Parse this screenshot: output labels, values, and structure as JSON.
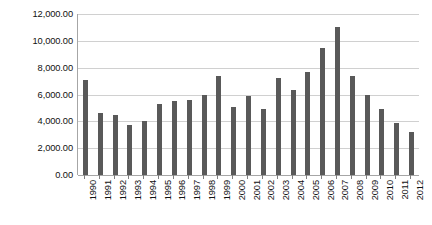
{
  "chart_data": {
    "type": "bar",
    "title": "",
    "subtitle": "",
    "xlabel": "",
    "ylabel": "",
    "grid": true,
    "legend": false,
    "legend_position": "none",
    "bar_color": "#595959",
    "gridline_color": "#d0d0d0",
    "axis_color": "#a6a6a6",
    "ylim": [
      0,
      12000
    ],
    "y_ticks": [
      0,
      2000,
      4000,
      6000,
      8000,
      10000,
      12000
    ],
    "y_tick_labels": [
      "0.00",
      "2,000.00",
      "4,000.00",
      "6,000.00",
      "8,000.00",
      "10,000.00",
      "12,000.00"
    ],
    "categories": [
      "1990",
      "1991",
      "1992",
      "1993",
      "1994",
      "1995",
      "1996",
      "1997",
      "1998",
      "1999",
      "2000",
      "2001",
      "2002",
      "2003",
      "2004",
      "2005",
      "2006",
      "2007",
      "2008",
      "2009",
      "2010",
      "2011",
      "2012"
    ],
    "values": [
      7100,
      4600,
      4500,
      3700,
      4000,
      5300,
      5500,
      5600,
      6000,
      7400,
      5100,
      5900,
      4900,
      7200,
      6300,
      7700,
      9500,
      11000,
      7400,
      6000,
      4900,
      3900,
      3200
    ]
  }
}
